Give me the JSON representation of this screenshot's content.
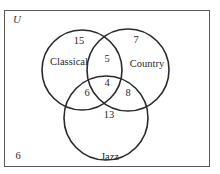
{
  "universe": {
    "label": "U",
    "outside_count": "6"
  },
  "sets": [
    {
      "name": "Classical",
      "cx": 82,
      "cy": 70,
      "r": 40
    },
    {
      "name": "Country",
      "cx": 128,
      "cy": 70,
      "r": 41
    },
    {
      "name": "Jazz",
      "cx": 106,
      "cy": 118,
      "r": 42
    }
  ],
  "regions": {
    "classical_only": "15",
    "country_only": "7",
    "jazz_only": "13",
    "classical_country": "5",
    "classical_jazz": "6",
    "country_jazz": "8",
    "all_three": "4"
  },
  "colors": {
    "stroke": "#2a2a2a",
    "border": "#5a5a5a",
    "background": "#ffffff"
  }
}
